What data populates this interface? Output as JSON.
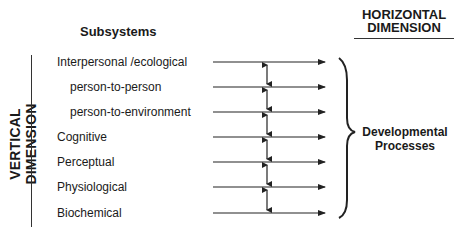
{
  "headers": {
    "subsystems": "Subsystems",
    "horizontal_line1": "HORIZONTAL",
    "horizontal_line2": "DIMENSION",
    "vertical": "VERTICAL DIMENSION"
  },
  "subsystems": [
    {
      "label": "Interpersonal /ecological",
      "indent": false
    },
    {
      "label": "person-to-person",
      "indent": true
    },
    {
      "label": "person-to-environment",
      "indent": true
    },
    {
      "label": "Cognitive",
      "indent": false
    },
    {
      "label": "Perceptual",
      "indent": false
    },
    {
      "label": "Physiological",
      "indent": false
    },
    {
      "label": "Biochemical",
      "indent": false
    }
  ],
  "processes": {
    "line1": "Developmental",
    "line2": "Processes"
  }
}
